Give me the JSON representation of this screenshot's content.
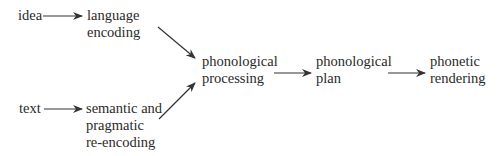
{
  "diagram": {
    "type": "flow",
    "nodes": {
      "idea": {
        "lines": [
          "idea"
        ]
      },
      "language_encoding": {
        "lines": [
          "language",
          "encoding"
        ]
      },
      "text": {
        "lines": [
          "text"
        ]
      },
      "semantic": {
        "lines": [
          "semantic and",
          "pragmatic",
          "re-encoding"
        ]
      },
      "phon_processing": {
        "lines": [
          "phonological",
          "processing"
        ]
      },
      "phon_plan": {
        "lines": [
          "phonological",
          "plan"
        ]
      },
      "phonetic_rendering": {
        "lines": [
          "phonetic",
          "rendering"
        ]
      }
    },
    "edges": [
      {
        "from": "idea",
        "to": "language encoding"
      },
      {
        "from": "text",
        "to": "semantic and pragmatic re-encoding"
      },
      {
        "from": "language encoding",
        "to": "phonological processing"
      },
      {
        "from": "semantic and pragmatic re-encoding",
        "to": "phonological processing"
      },
      {
        "from": "phonological processing",
        "to": "phonological plan"
      },
      {
        "from": "phonological plan",
        "to": "phonetic rendering"
      }
    ],
    "colors": {
      "text": "#2a2a2a",
      "arrow": "#333333",
      "background": "#ffffff"
    }
  }
}
